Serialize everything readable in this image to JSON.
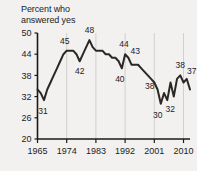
{
  "chart_data": {
    "type": "line",
    "title": "Percent who\nanswered yes",
    "xlabel": "",
    "ylabel": "",
    "xlim": [
      1965,
      2012
    ],
    "ylim": [
      20,
      50
    ],
    "grid": true,
    "legend": false,
    "yticks": [
      20,
      26,
      32,
      38,
      44,
      50
    ],
    "xticks": [
      1965,
      1974,
      1983,
      1992,
      2001,
      2010
    ],
    "ytick_labels": [
      "20",
      "26",
      "32",
      "38",
      "44",
      "50"
    ],
    "xtick_labels": [
      "1965",
      "1974",
      "1983",
      "1992",
      "2001",
      "2010"
    ],
    "x": [
      1965,
      1966,
      1967,
      1968,
      1969,
      1970,
      1971,
      1972,
      1973,
      1974,
      1975,
      1976,
      1977,
      1978,
      1979,
      1980,
      1981,
      1982,
      1983,
      1984,
      1985,
      1986,
      1987,
      1988,
      1989,
      1990,
      1991,
      1992,
      1993,
      1994,
      1995,
      1996,
      1997,
      1998,
      1999,
      2000,
      2001,
      2002,
      2003,
      2004,
      2005,
      2006,
      2007,
      2008,
      2009,
      2010,
      2011,
      2012
    ],
    "values": [
      34,
      33,
      31,
      34,
      36,
      38,
      40,
      42,
      44,
      45,
      45,
      45,
      44,
      42,
      44,
      46,
      48,
      46,
      45,
      45,
      45,
      44,
      44,
      43,
      43,
      42,
      40,
      44,
      43,
      41,
      41,
      41,
      40,
      39,
      38,
      37,
      36,
      34,
      30,
      33,
      31,
      36,
      32,
      37,
      38,
      36,
      37,
      34
    ],
    "annotations": [
      {
        "label": "31",
        "x": 1967,
        "y": 31
      },
      {
        "label": "45",
        "x": 1974,
        "y": 45
      },
      {
        "label": "42",
        "x": 1978,
        "y": 42
      },
      {
        "label": "48",
        "x": 1981,
        "y": 48
      },
      {
        "label": "40",
        "x": 1991,
        "y": 40
      },
      {
        "label": "44",
        "x": 1992,
        "y": 44
      },
      {
        "label": "43",
        "x": 1993,
        "y": 43
      },
      {
        "label": "38",
        "x": 1999,
        "y": 38
      },
      {
        "label": "30",
        "x": 2003,
        "y": 30
      },
      {
        "label": "32",
        "x": 2005,
        "y": 32
      },
      {
        "label": "38",
        "x": 2009,
        "y": 38
      },
      {
        "label": "37",
        "x": 2011,
        "y": 37
      }
    ]
  },
  "colors": {
    "background": "#f2f1ef",
    "line": "#2b2724",
    "axis": "#1c1a18",
    "grid": "#d2d0cc",
    "text": "#24211e"
  }
}
